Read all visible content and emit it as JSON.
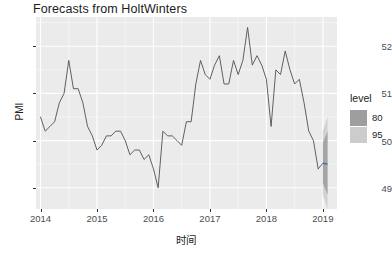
{
  "chart_data": {
    "type": "line",
    "title": "Forecasts from HoltWinters",
    "xlabel": "时间",
    "ylabel": "PMI",
    "grid": true,
    "legend_position": "right",
    "xlim": [
      2013.92,
      2019.25
    ],
    "ylim": [
      48.55,
      52.62
    ],
    "x_ticks": [
      2014,
      2015,
      2016,
      2017,
      2018,
      2019
    ],
    "x_tick_labels": [
      "2014",
      "2015",
      "2016",
      "2017",
      "2018",
      "2019"
    ],
    "y_ticks": [
      49,
      50,
      51,
      52
    ],
    "y_tick_labels": [
      "49",
      "50",
      "51",
      "52"
    ],
    "series": [
      {
        "name": "PMI",
        "color": "#595959",
        "x": [
          2014.0,
          2014.083,
          2014.167,
          2014.25,
          2014.333,
          2014.417,
          2014.5,
          2014.583,
          2014.667,
          2014.75,
          2014.833,
          2014.917,
          2015.0,
          2015.083,
          2015.167,
          2015.25,
          2015.333,
          2015.417,
          2015.5,
          2015.583,
          2015.667,
          2015.75,
          2015.833,
          2015.917,
          2016.0,
          2016.083,
          2016.167,
          2016.25,
          2016.333,
          2016.417,
          2016.5,
          2016.583,
          2016.667,
          2016.75,
          2016.833,
          2016.917,
          2017.0,
          2017.083,
          2017.167,
          2017.25,
          2017.333,
          2017.417,
          2017.5,
          2017.583,
          2017.667,
          2017.75,
          2017.833,
          2017.917,
          2018.0,
          2018.083,
          2018.167,
          2018.25,
          2018.333,
          2018.417,
          2018.5,
          2018.583,
          2018.667,
          2018.75,
          2018.833,
          2018.917
        ],
        "values": [
          50.5,
          50.2,
          50.3,
          50.4,
          50.8,
          51.0,
          51.7,
          51.1,
          51.1,
          50.8,
          50.3,
          50.1,
          49.8,
          49.9,
          50.1,
          50.1,
          50.2,
          50.2,
          50.0,
          49.7,
          49.8,
          49.8,
          49.6,
          49.7,
          49.4,
          49.0,
          50.2,
          50.1,
          50.1,
          50.0,
          49.9,
          50.4,
          50.4,
          51.2,
          51.7,
          51.4,
          51.3,
          51.6,
          51.8,
          51.2,
          51.2,
          51.7,
          51.4,
          51.7,
          52.4,
          51.6,
          51.8,
          51.6,
          51.3,
          50.3,
          51.5,
          51.4,
          51.9,
          51.5,
          51.2,
          51.3,
          50.8,
          50.2,
          50.0,
          49.4
        ]
      }
    ],
    "forecast": {
      "name": "HoltWinters point forecast",
      "x": [
        2019.0,
        2019.083
      ],
      "values": [
        49.52,
        49.5
      ],
      "color": "#3b6ea8",
      "intervals": [
        {
          "level": 80,
          "color": "#9e9e9e",
          "lower": [
            49.1,
            48.85
          ],
          "upper": [
            49.95,
            50.2
          ]
        },
        {
          "level": 95,
          "color": "#cccccc",
          "lower": [
            48.85,
            48.55
          ],
          "upper": [
            50.2,
            50.5
          ]
        }
      ]
    }
  },
  "legend": {
    "title": "level",
    "entries": [
      {
        "label": "80",
        "color": "#9e9e9e"
      },
      {
        "label": "95",
        "color": "#cccccc"
      }
    ]
  }
}
